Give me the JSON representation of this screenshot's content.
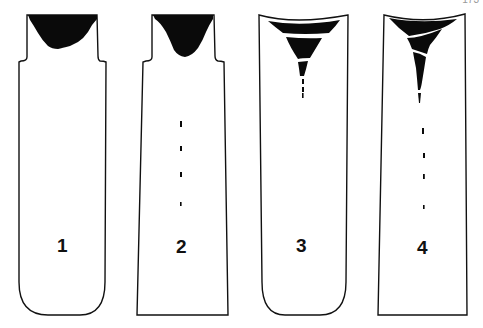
{
  "figure": {
    "type": "ingot-pipe-shrinkage-diagram",
    "page_number_partial": "173",
    "panels": [
      {
        "id": 1,
        "label": "1",
        "shape": "hot-topped mold, rounded bottom",
        "cavity": "shallow concentrated shrinkage in head",
        "secondary_pipe_segments": 0
      },
      {
        "id": 2,
        "label": "2",
        "shape": "hot-topped mold, square bottom",
        "cavity": "deeper shrinkage in head",
        "secondary_pipe_segments": 4
      },
      {
        "id": 3,
        "label": "3",
        "shape": "open-top mold, rounded bottom",
        "cavity": "layered V-shaped pipe",
        "secondary_pipe_segments": 3
      },
      {
        "id": 4,
        "label": "4",
        "shape": "open-top mold, square bottom",
        "cavity": "long layered V-shaped pipe",
        "secondary_pipe_segments": 4
      }
    ],
    "colors": {
      "ink": "#111111",
      "background": "#ffffff"
    }
  }
}
